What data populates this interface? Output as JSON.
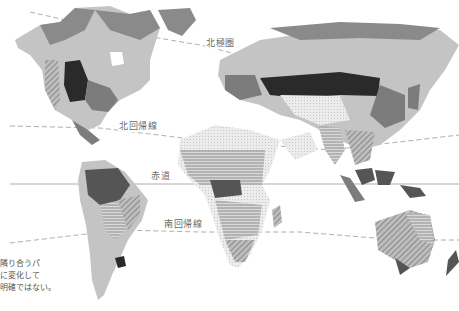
{
  "map": {
    "title": "",
    "style": "grayscale world vegetation / biome map",
    "colors": {
      "tundra": "#8a8a8a",
      "boreal": "#c4c4c4",
      "temperate": "#7c7c7c",
      "steppe_dark": "#2a2a2a",
      "desert": "#e6e6e6",
      "savanna_hatch": "#a9a9a9",
      "rainforest": "#555555",
      "line": "#9a9a9a"
    },
    "lines": [
      {
        "id": "arctic_circle",
        "label": "北極圏",
        "style": "dashed"
      },
      {
        "id": "tropic_of_cancer",
        "label": "北回帰線",
        "style": "dashed"
      },
      {
        "id": "equator",
        "label": "赤道",
        "style": "solid"
      },
      {
        "id": "tropic_of_capricorn",
        "label": "南回帰線",
        "style": "dashed"
      }
    ],
    "caption_lines": [
      "隣り合うパ",
      "に変化して",
      "明確ではない。"
    ]
  }
}
